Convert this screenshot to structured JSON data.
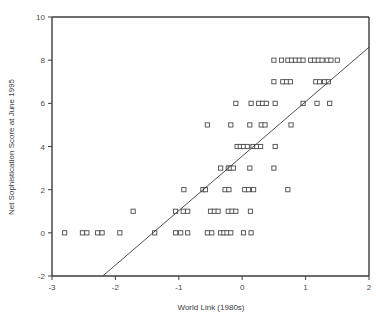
{
  "chart_data": {
    "type": "scatter",
    "title": "",
    "xlabel": "World Link (1980s)",
    "ylabel": "Net Sophistication Score at June 1995",
    "xlim": [
      -3,
      2
    ],
    "ylim": [
      -2,
      10
    ],
    "xticks": [
      -3,
      -2,
      -1,
      0,
      1,
      2
    ],
    "yticks": [
      -2,
      0,
      2,
      4,
      6,
      8,
      10
    ],
    "xtick_labels": [
      "-3",
      "-2",
      "-1",
      "0",
      "1",
      "2"
    ],
    "ytick_labels": [
      "-2",
      "0",
      "2",
      "4",
      "6",
      "8",
      "10"
    ],
    "grid": false,
    "legend": "none",
    "marker_style": "open-square",
    "points": [
      [
        -2.8,
        0
      ],
      [
        -2.52,
        0
      ],
      [
        -2.45,
        0
      ],
      [
        -2.28,
        0
      ],
      [
        -2.21,
        0
      ],
      [
        -1.93,
        0
      ],
      [
        -1.38,
        0
      ],
      [
        -1.05,
        0
      ],
      [
        -0.97,
        0
      ],
      [
        -0.86,
        0
      ],
      [
        -0.55,
        0
      ],
      [
        -0.48,
        0
      ],
      [
        -0.34,
        0
      ],
      [
        -0.29,
        0
      ],
      [
        -0.24,
        0
      ],
      [
        -0.18,
        0
      ],
      [
        0.02,
        0
      ],
      [
        0.14,
        0
      ],
      [
        -1.72,
        1
      ],
      [
        -1.05,
        1
      ],
      [
        -0.93,
        1
      ],
      [
        -0.86,
        1
      ],
      [
        -0.5,
        1
      ],
      [
        -0.44,
        1
      ],
      [
        -0.38,
        1
      ],
      [
        -0.22,
        1
      ],
      [
        -0.16,
        1
      ],
      [
        -0.1,
        1
      ],
      [
        0.13,
        1
      ],
      [
        -0.92,
        2
      ],
      [
        -0.62,
        2
      ],
      [
        -0.58,
        2
      ],
      [
        -0.27,
        2
      ],
      [
        -0.21,
        2
      ],
      [
        0.04,
        2
      ],
      [
        0.1,
        2
      ],
      [
        0.18,
        2
      ],
      [
        0.72,
        2
      ],
      [
        -0.34,
        3
      ],
      [
        -0.22,
        3
      ],
      [
        -0.19,
        3
      ],
      [
        -0.14,
        3
      ],
      [
        0.12,
        3
      ],
      [
        0.5,
        3
      ],
      [
        -0.08,
        4
      ],
      [
        -0.03,
        4
      ],
      [
        0.02,
        4
      ],
      [
        0.08,
        4
      ],
      [
        0.17,
        4
      ],
      [
        0.23,
        4
      ],
      [
        0.29,
        4
      ],
      [
        0.52,
        4
      ],
      [
        -0.55,
        5
      ],
      [
        -0.18,
        5
      ],
      [
        0.12,
        5
      ],
      [
        0.3,
        5
      ],
      [
        0.36,
        5
      ],
      [
        0.77,
        5
      ],
      [
        -0.1,
        6
      ],
      [
        0.14,
        6
      ],
      [
        0.26,
        6
      ],
      [
        0.32,
        6
      ],
      [
        0.38,
        6
      ],
      [
        0.52,
        6
      ],
      [
        0.96,
        6
      ],
      [
        1.18,
        6
      ],
      [
        1.38,
        6
      ],
      [
        0.5,
        7
      ],
      [
        0.64,
        7
      ],
      [
        0.7,
        7
      ],
      [
        0.76,
        7
      ],
      [
        1.16,
        7
      ],
      [
        1.22,
        7
      ],
      [
        1.3,
        7
      ],
      [
        1.36,
        7
      ],
      [
        0.5,
        8
      ],
      [
        0.62,
        8
      ],
      [
        0.72,
        8
      ],
      [
        0.78,
        8
      ],
      [
        0.84,
        8
      ],
      [
        0.9,
        8
      ],
      [
        0.96,
        8
      ],
      [
        1.08,
        8
      ],
      [
        1.14,
        8
      ],
      [
        1.2,
        8
      ],
      [
        1.26,
        8
      ],
      [
        1.34,
        8
      ],
      [
        1.4,
        8
      ],
      [
        1.5,
        8
      ]
    ],
    "fit_line": {
      "x_start": -2.2,
      "y_start": -2.0,
      "x_end": 2.0,
      "y_end": 8.6
    }
  }
}
